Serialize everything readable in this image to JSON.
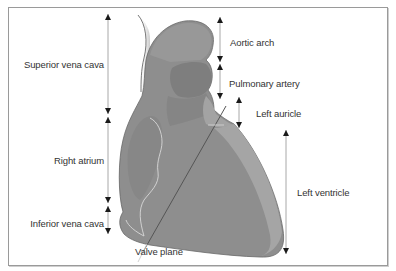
{
  "figure": {
    "type": "anatomical-diagram",
    "colors": {
      "frame": "#9a9a9a",
      "heart_base": "#8e8e8e",
      "heart_dark": "#7f7f7f",
      "heart_light": "#a6a6a6",
      "arrow_line": "#a8a8a8",
      "arrow_head": "#1a1a1a",
      "text": "#333333",
      "valve_plane_line": "#555555",
      "atrium_outline": "#d8d8d8"
    }
  },
  "labels": {
    "left_side": [
      {
        "id": "superior-vena-cava",
        "text": "Superior vena cava"
      },
      {
        "id": "right-atrium",
        "text": "Right atrium"
      },
      {
        "id": "inferior-vena-cava",
        "text": "Inferior vena cava"
      }
    ],
    "right_side": [
      {
        "id": "aortic-arch",
        "text": "Aortic arch"
      },
      {
        "id": "pulmonary-artery",
        "text": "Pulmonary artery"
      },
      {
        "id": "left-auricle",
        "text": "Left auricle"
      },
      {
        "id": "left-ventricle",
        "text": "Left ventricle"
      }
    ],
    "bottom": {
      "id": "valve-plane",
      "text": "Valve plane"
    }
  }
}
